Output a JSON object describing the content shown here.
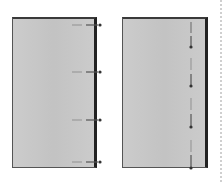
{
  "diagram": {
    "left_panel": {
      "label": "",
      "arrow_direction": "right",
      "arrow_count": 4,
      "arrow_y": [
        28,
        72,
        120,
        162
      ]
    },
    "right_panel": {
      "label": "",
      "line_orientation": "vertical",
      "marker_count": 4,
      "marker_y": [
        47,
        86,
        127,
        168
      ]
    },
    "colors": {
      "panel_fill": "#c9c9c9",
      "border": "#2a2a2a",
      "arrow": "#444444",
      "dash_light": "#9a9a9a"
    }
  }
}
